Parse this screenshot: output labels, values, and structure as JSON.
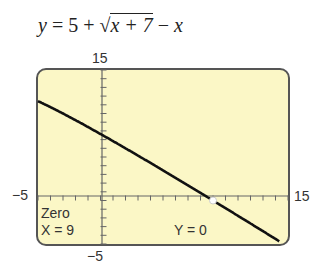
{
  "equation": {
    "lhs": "y",
    "equals": "=",
    "constant": "5",
    "plus": "+",
    "radical": "√",
    "radicand": "x + 7",
    "minus": "−",
    "tail": "x"
  },
  "screen": {
    "background": "#fbf7c6",
    "border": "#555555",
    "ymax_label": "15",
    "ymin_label": "−5",
    "xmin_label": "−5",
    "xmax_label": "15",
    "readout_title": "Zero",
    "readout_x": "X = 9",
    "readout_y": "Y = 0"
  },
  "chart_data": {
    "type": "line",
    "function": "5 + sqrt(x + 7) - x",
    "xlim": [
      -5,
      15
    ],
    "ylim": [
      -5,
      15
    ],
    "xscale": 1,
    "yscale": 1,
    "grid": false,
    "x": [
      -5,
      -3,
      0,
      3,
      6,
      9,
      12,
      15
    ],
    "y": [
      11.41,
      10.16,
      7.65,
      5.16,
      2.61,
      0.0,
      -2.64,
      -5.31
    ],
    "annotations": [
      {
        "text": "Zero",
        "position": "bottom-left"
      },
      {
        "text": "X = 9",
        "position": "bottom-left"
      },
      {
        "text": "Y = 0",
        "position": "bottom-center"
      }
    ],
    "marked_point": {
      "x": 9,
      "y": 0
    }
  }
}
